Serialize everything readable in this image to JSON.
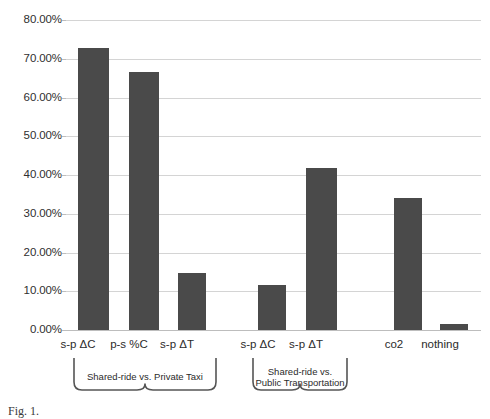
{
  "chart_data": {
    "type": "bar",
    "title": "",
    "xlabel": "",
    "ylabel": "",
    "ylim": [
      0,
      80
    ],
    "ytick_labels": [
      "80.00%",
      "70.00%",
      "60.00%",
      "50.00%",
      "40.00%",
      "30.00%",
      "20.00%",
      "10.00%",
      "0.00%"
    ],
    "ytick_values": [
      80,
      70,
      60,
      50,
      40,
      30,
      20,
      10,
      0
    ],
    "grid": true,
    "legend": "none",
    "bar_color": "#4a4a4a",
    "gridline_color": "#d4d4d4",
    "categories": [
      "s-p ΔC",
      "p-s %C",
      "s-p ΔT",
      "s-p ΔC",
      "s-p ΔT",
      "co2",
      "nothing"
    ],
    "values": [
      72.8,
      66.7,
      14.6,
      11.5,
      41.8,
      34.0,
      1.5
    ],
    "bars": [
      {
        "label": "s-p ΔC",
        "value": 72.8,
        "group": "Shared-ride vs. Private Taxi"
      },
      {
        "label": "p-s %C",
        "value": 66.7,
        "group": "Shared-ride vs. Private Taxi"
      },
      {
        "label": "s-p ΔT",
        "value": 14.6,
        "group": "Shared-ride vs. Private Taxi"
      },
      {
        "label": "s-p ΔC",
        "value": 11.5,
        "group": "Shared-ride vs. Public Transportation"
      },
      {
        "label": "s-p ΔT",
        "value": 41.8,
        "group": "Shared-ride vs. Public Transportation"
      },
      {
        "label": "co2",
        "value": 34.0,
        "group": ""
      },
      {
        "label": "nothing",
        "value": 1.5,
        "group": ""
      }
    ],
    "groups": [
      {
        "caption_line1": "Shared-ride vs. Private Taxi",
        "caption_line2": "",
        "bar_indices": [
          0,
          1,
          2
        ]
      },
      {
        "caption_line1": "Shared-ride vs.",
        "caption_line2": "Public Transportation",
        "bar_indices": [
          3,
          4
        ]
      }
    ]
  },
  "caption": {
    "text": "Fig. 1."
  }
}
